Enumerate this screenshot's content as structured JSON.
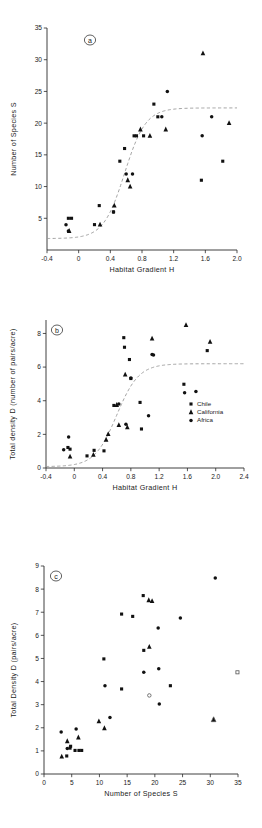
{
  "figure": {
    "panel_labels": {
      "a": "a",
      "b": "b",
      "c": "c"
    }
  },
  "legend": {
    "position": "inside-right-middle",
    "entries": [
      {
        "label": "Chile",
        "marker": "square"
      },
      {
        "label": "California",
        "marker": "triangle"
      },
      {
        "label": "Africa",
        "marker": "circle"
      }
    ]
  },
  "chart_data": [
    {
      "type": "scatter",
      "panel": "a",
      "title": "",
      "xlabel": "Habitat Gradient H",
      "ylabel": "Number of Species S",
      "xlim": [
        -0.4,
        2.0
      ],
      "ylim": [
        0,
        35
      ],
      "xticks": [
        -0.4,
        0,
        0.4,
        0.8,
        1.2,
        1.6,
        2.0
      ],
      "xticklabels": [
        "-0.4",
        "0",
        "0.4",
        "0.8",
        "1.2",
        "1.6",
        "2.0"
      ],
      "yticks": [
        5,
        10,
        15,
        20,
        25,
        30,
        35
      ],
      "yticklabels": [
        "5",
        "10",
        "15",
        "20",
        "25",
        "30",
        "35"
      ],
      "grid": false,
      "series": [
        {
          "name": "Chile",
          "marker": "square",
          "points": [
            [
              -0.13,
              5
            ],
            [
              -0.09,
              5
            ],
            [
              0.2,
              4
            ],
            [
              0.26,
              7
            ],
            [
              0.44,
              6
            ],
            [
              0.52,
              14
            ],
            [
              0.58,
              16
            ],
            [
              0.7,
              18
            ],
            [
              0.73,
              18
            ],
            [
              0.82,
              18
            ],
            [
              0.95,
              23
            ],
            [
              1.0,
              21
            ],
            [
              1.55,
              11
            ],
            [
              1.82,
              14
            ]
          ]
        },
        {
          "name": "California",
          "marker": "triangle",
          "points": [
            [
              -0.12,
              3
            ],
            [
              0.27,
              4
            ],
            [
              0.45,
              7
            ],
            [
              0.62,
              11
            ],
            [
              0.65,
              10
            ],
            [
              0.78,
              19
            ],
            [
              0.9,
              18
            ],
            [
              1.1,
              19
            ],
            [
              1.57,
              31
            ],
            [
              1.9,
              20
            ]
          ]
        },
        {
          "name": "Africa",
          "marker": "circle",
          "points": [
            [
              -0.16,
              4
            ],
            [
              -0.13,
              3
            ],
            [
              0.44,
              6
            ],
            [
              0.6,
              12
            ],
            [
              0.68,
              12
            ],
            [
              1.05,
              21
            ],
            [
              1.12,
              25
            ],
            [
              1.56,
              18
            ],
            [
              1.68,
              21
            ]
          ]
        }
      ],
      "fit_curve": {
        "shape": "sigmoid",
        "asymptote": 22.4,
        "midpoint": 0.58,
        "baseline": 1.8
      }
    },
    {
      "type": "scatter",
      "panel": "b",
      "title": "",
      "xlabel": "Habitat Gradient H",
      "ylabel": "Total density D (number of pairs/acre)",
      "xlim": [
        -0.4,
        2.4
      ],
      "ylim": [
        0,
        8.8
      ],
      "xticks": [
        -0.4,
        0,
        0.4,
        0.8,
        1.2,
        1.6,
        2.0,
        2.4
      ],
      "xticklabels": [
        "-0.4",
        "0",
        "0.4",
        "0.8",
        "1.2",
        "1.6",
        "2.0",
        "2.4"
      ],
      "yticks": [
        0,
        2,
        4,
        6,
        8
      ],
      "yticklabels": [
        "0",
        "2",
        "4",
        "6",
        "8"
      ],
      "grid": false,
      "series": [
        {
          "name": "Chile",
          "marker": "square",
          "points": [
            [
              -0.09,
              1.22
            ],
            [
              -0.06,
              1.12
            ],
            [
              0.18,
              0.72
            ],
            [
              0.28,
              1.05
            ],
            [
              0.42,
              1.02
            ],
            [
              0.56,
              3.72
            ],
            [
              0.7,
              7.75
            ],
            [
              0.71,
              7.18
            ],
            [
              0.78,
              6.45
            ],
            [
              0.8,
              5.32
            ],
            [
              0.93,
              3.9
            ],
            [
              0.95,
              2.32
            ],
            [
              1.55,
              4.98
            ],
            [
              1.88,
              6.98
            ]
          ]
        },
        {
          "name": "California",
          "marker": "triangle",
          "points": [
            [
              -0.06,
              0.68
            ],
            [
              0.27,
              0.78
            ],
            [
              0.45,
              1.68
            ],
            [
              0.48,
              2.02
            ],
            [
              0.6,
              3.75
            ],
            [
              0.63,
              2.55
            ],
            [
              0.72,
              5.55
            ],
            [
              0.75,
              2.42
            ],
            [
              1.1,
              7.7
            ],
            [
              1.58,
              8.5
            ],
            [
              1.92,
              7.5
            ]
          ]
        },
        {
          "name": "Africa",
          "marker": "circle",
          "points": [
            [
              -0.15,
              1.08
            ],
            [
              -0.08,
              1.85
            ],
            [
              0.63,
              3.8
            ],
            [
              0.73,
              2.6
            ],
            [
              0.8,
              5.35
            ],
            [
              1.05,
              3.1
            ],
            [
              1.12,
              6.72
            ],
            [
              1.1,
              6.75
            ],
            [
              1.56,
              4.48
            ],
            [
              1.72,
              4.55
            ]
          ]
        }
      ],
      "fit_curve": {
        "shape": "sigmoid",
        "asymptote": 6.2,
        "midpoint": 0.6,
        "baseline": 0.08
      }
    },
    {
      "type": "scatter",
      "panel": "c",
      "title": "",
      "xlabel": "Number of Species S",
      "ylabel": "Total Density D (pairs/acre)",
      "xlim": [
        0,
        35
      ],
      "ylim": [
        0,
        9
      ],
      "xticks": [
        0,
        5,
        10,
        15,
        20,
        25,
        30,
        35
      ],
      "xticklabels": [
        "0",
        "5",
        "10",
        "15",
        "20",
        "25",
        "30",
        "35"
      ],
      "yticks": [
        0,
        1,
        2,
        3,
        4,
        5,
        6,
        7,
        8,
        9
      ],
      "yticklabels": [
        "0",
        "1",
        "2",
        "3",
        "4",
        "5",
        "6",
        "7",
        "8",
        "9"
      ],
      "grid": false,
      "series": [
        {
          "name": "Chile",
          "marker": "square",
          "points": [
            [
              4.1,
              0.78
            ],
            [
              4.7,
              1.12
            ],
            [
              4.8,
              1.2
            ],
            [
              5.6,
              1.02
            ],
            [
              6.3,
              1.02
            ],
            [
              6.8,
              1.02
            ],
            [
              10.8,
              4.98
            ],
            [
              14.0,
              3.68
            ],
            [
              14.0,
              6.92
            ],
            [
              16.0,
              6.82
            ],
            [
              17.9,
              7.72
            ],
            [
              18.0,
              5.35
            ],
            [
              22.8,
              3.82
            ]
          ]
        },
        {
          "name": "California",
          "marker": "triangle",
          "points": [
            [
              3.2,
              0.75
            ],
            [
              4.2,
              1.42
            ],
            [
              6.2,
              1.58
            ],
            [
              9.9,
              2.28
            ],
            [
              10.9,
              1.98
            ],
            [
              18.9,
              7.52
            ],
            [
              19.5,
              7.48
            ],
            [
              19.0,
              5.5
            ],
            [
              30.6,
              2.35
            ]
          ]
        },
        {
          "name": "Africa",
          "marker": "circle",
          "points": [
            [
              3.1,
              1.82
            ],
            [
              4.2,
              1.1
            ],
            [
              5.8,
              1.95
            ],
            [
              11.9,
              2.45
            ],
            [
              11.0,
              3.82
            ],
            [
              18.0,
              4.4
            ],
            [
              20.6,
              6.32
            ],
            [
              20.7,
              4.55
            ],
            [
              20.8,
              3.03
            ],
            [
              24.6,
              6.75
            ],
            [
              30.9,
              8.48
            ]
          ]
        },
        {
          "name": "open-markers",
          "marker": "open",
          "points": [
            [
              19.0,
              3.4
            ],
            [
              30.6,
              2.35
            ],
            [
              34.9,
              4.4
            ]
          ]
        }
      ]
    }
  ]
}
